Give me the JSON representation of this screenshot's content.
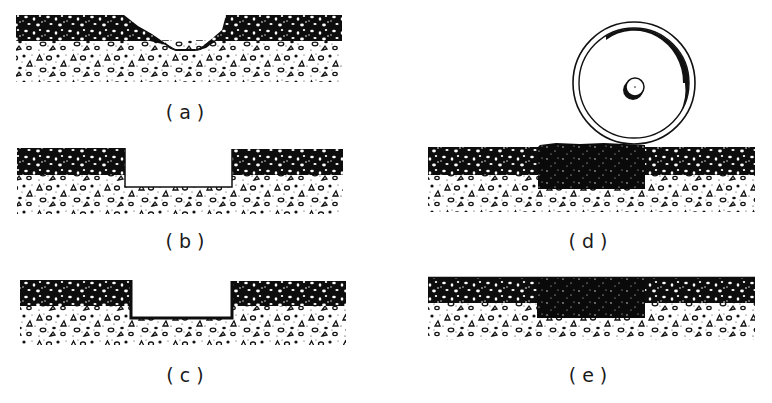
{
  "figure": {
    "panels": [
      {
        "id": "a",
        "label": "(a)",
        "stage": "pothole in asphalt surface"
      },
      {
        "id": "b",
        "label": "(b)",
        "stage": "hole cut square with vertical sides"
      },
      {
        "id": "c",
        "label": "(c)",
        "stage": "hole edges and bottom tack-coated"
      },
      {
        "id": "d",
        "label": "(d)",
        "stage": "patch mix placed and compacted with roller"
      },
      {
        "id": "e",
        "label": "(e)",
        "stage": "completed patch flush with surface"
      }
    ],
    "layers": [
      "asphalt surface course",
      "aggregate base"
    ],
    "colors": {
      "asphalt": "#0d0d0d",
      "aggregate_outline": "#111111",
      "background": "#ffffff"
    }
  }
}
